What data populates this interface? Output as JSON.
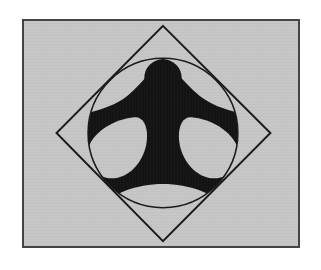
{
  "image": {
    "title": "Human figure inscribed in circle and rotated square",
    "description": "Black silhouette of a standing human figure with outstretched arms inscribed inside a circle, which is inscribed inside a square rotated 45 degrees",
    "canvas": {
      "width": 321,
      "height": 270,
      "outer_background_color": "#ffffff"
    },
    "panel": {
      "x": 22,
      "y": 19,
      "width": 278,
      "height": 229,
      "background_color": "#c6c6c6",
      "border_color": "#444444",
      "border_width": 2
    },
    "shapes": {
      "diamond": {
        "name": "rotated-square",
        "stroke_color": "#1a1a1a",
        "stroke_width": 2,
        "fill": "none",
        "vertices": [
          {
            "x": 141,
            "y": 5
          },
          {
            "x": 250,
            "y": 114
          },
          {
            "x": 141,
            "y": 224
          },
          {
            "x": 33,
            "y": 114
          }
        ]
      },
      "circle": {
        "name": "inscribed-circle",
        "stroke_color": "#1a1a1a",
        "stroke_width": 2,
        "fill": "none",
        "center_x": 141,
        "center_y": 114,
        "radius": 76
      },
      "head": {
        "name": "figure-head",
        "fill_color": "#141414",
        "center_x": 141,
        "center_y": 58,
        "radius": 18
      },
      "body": {
        "name": "figure-body",
        "fill_color": "#141414"
      },
      "cutout_left": {
        "name": "left-armpit-cutout",
        "fill_color": "#c6c6c6"
      },
      "cutout_right": {
        "name": "right-armpit-cutout",
        "fill_color": "#c6c6c6"
      },
      "cutout_bottom": {
        "name": "between-legs-cutout",
        "fill_color": "#c6c6c6"
      }
    }
  }
}
